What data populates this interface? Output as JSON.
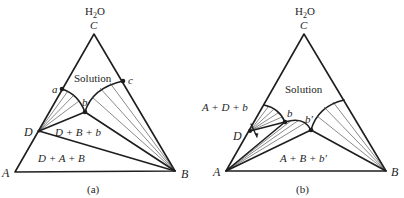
{
  "figure": {
    "panels": [
      {
        "id": "a",
        "caption": "(a)",
        "apex_formula": {
          "base": "H",
          "sub": "2",
          "rest": "O"
        },
        "vertices": {
          "C": "C",
          "A": "A",
          "B": "B"
        },
        "points": {
          "D": "D",
          "a": "a",
          "b": "b",
          "c": "c"
        },
        "regions": {
          "solution": "Solution",
          "dbb": "D + B + b",
          "dab": "D + A + B"
        }
      },
      {
        "id": "b",
        "caption": "(b)",
        "apex_formula": {
          "base": "H",
          "sub": "2",
          "rest": "O"
        },
        "vertices": {
          "C": "C",
          "A": "A",
          "B": "B"
        },
        "points": {
          "D": "D",
          "b": "b",
          "b_prime": "b′"
        },
        "regions": {
          "solution": "Solution",
          "adb": "A + D + b",
          "abb": "A + B + b′"
        }
      }
    ]
  }
}
